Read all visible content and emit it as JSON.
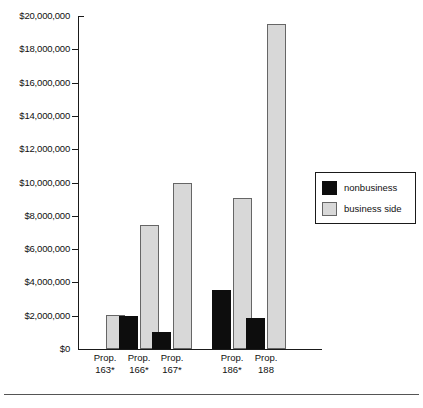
{
  "chart_data": {
    "type": "bar",
    "title": "",
    "subtitle": "",
    "xlabel": "",
    "ylabel": "",
    "ylim": [
      0,
      20000000
    ],
    "grid": false,
    "legend_position": "right",
    "categories": [
      "Prop. 163*",
      "Prop. 166*",
      "Prop. 167*",
      "Prop. 186*",
      "Prop. 188"
    ],
    "category_lines": [
      {
        "line1": "Prop.",
        "line2": "163*"
      },
      {
        "line1": "Prop.",
        "line2": "166*"
      },
      {
        "line1": "Prop.",
        "line2": "167*"
      },
      {
        "line1": "Prop.",
        "line2": "186*"
      },
      {
        "line1": "Prop.",
        "line2": "188"
      }
    ],
    "series": [
      {
        "name": "nonbusiness",
        "color": "#0d0d0d",
        "values": [
          0,
          2000000,
          1050000,
          3550000,
          1880000
        ]
      },
      {
        "name": "business side",
        "color": "#d8d8d8",
        "values": [
          2050000,
          7450000,
          9970000,
          9080000,
          19520000
        ]
      }
    ],
    "ytick_labels": [
      "$20,000,000",
      "$18,000,000",
      "$16,000,000",
      "$14,000,000",
      "$12,000,000",
      "$10,000,000",
      "$8,000,000",
      "$6,000,000",
      "$4,000,000",
      "$2,000,000",
      "$0"
    ],
    "ytick_values": [
      20000000,
      18000000,
      16000000,
      14000000,
      12000000,
      10000000,
      8000000,
      6000000,
      4000000,
      2000000,
      0
    ]
  },
  "legend": {
    "entries": [
      {
        "label": "nonbusiness",
        "color": "#0d0d0d"
      },
      {
        "label": "business side",
        "color": "#d8d8d8"
      }
    ]
  }
}
